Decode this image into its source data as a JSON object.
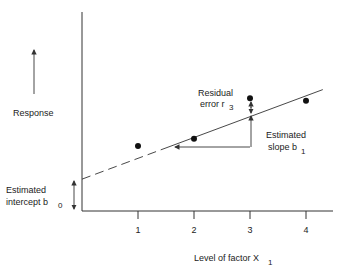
{
  "chart_data": {
    "type": "scatter",
    "title": "",
    "xlabel": "Level of factor X",
    "xlabel_subscript": "1",
    "ylabel": "Response",
    "x_ticks": [
      "1",
      "2",
      "3",
      "4"
    ],
    "points": [
      {
        "x": 1,
        "y": 2.65
      },
      {
        "x": 2,
        "y": 2.95
      },
      {
        "x": 3,
        "y": 4.6
      },
      {
        "x": 4,
        "y": 4.5
      }
    ],
    "fitted_line": {
      "intercept": 1.3,
      "slope": 0.85,
      "x_start": 0,
      "x_end": 4.3,
      "dashed_until_x": 1.5
    },
    "annotations": {
      "residual": {
        "line1": "Residual",
        "line2": "error r",
        "subscript": "3"
      },
      "slope": {
        "line1": "Estimated",
        "line2": "slope b",
        "subscript": "1"
      },
      "intercept": {
        "line1": "Estimated",
        "line2": "intercept b",
        "subscript": "0"
      }
    }
  }
}
